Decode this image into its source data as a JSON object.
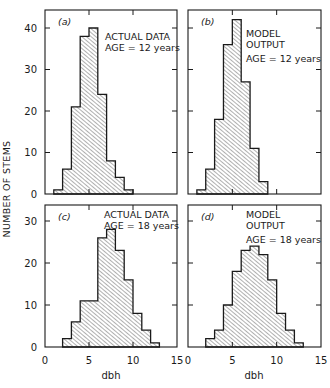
{
  "chart_data": [
    {
      "type": "bar",
      "panel": "(a)",
      "annotation": [
        "ACTUAL DATA",
        "AGE = 12 years"
      ],
      "bin_width": 1,
      "bin_edges_start": 1,
      "categories": [
        "1-2",
        "2-3",
        "3-4",
        "4-5",
        "5-6",
        "6-7",
        "7-8",
        "8-9",
        "9-10"
      ],
      "values": [
        1,
        6,
        21,
        38,
        40,
        24,
        8,
        4,
        1
      ],
      "xlabel": "",
      "ylabel": "NUMBER OF STEMS",
      "xlim": [
        0,
        15
      ],
      "ylim": [
        0,
        44
      ],
      "yticks": [
        0,
        10,
        20,
        30,
        40
      ],
      "xticks": [
        0,
        5,
        10,
        15
      ],
      "fill": "hatched"
    },
    {
      "type": "bar",
      "panel": "(b)",
      "annotation": [
        "MODEL",
        "OUTPUT",
        "AGE = 12 years"
      ],
      "bin_width": 1,
      "bin_edges_start": 1,
      "categories": [
        "1-2",
        "2-3",
        "3-4",
        "4-5",
        "5-6",
        "6-7",
        "7-8",
        "8-9"
      ],
      "values": [
        1,
        6,
        18,
        36,
        42,
        27,
        11,
        3
      ],
      "xlabel": "",
      "ylabel": "",
      "xlim": [
        0,
        15
      ],
      "ylim": [
        0,
        44
      ],
      "yticks": [
        0,
        10,
        20,
        30,
        40
      ],
      "xticks": [
        0,
        5,
        10,
        15
      ],
      "fill": "hatched"
    },
    {
      "type": "bar",
      "panel": "(c)",
      "annotation": [
        "ACTUAL DATA",
        "AGE = 18 years"
      ],
      "bin_width": 1,
      "bin_edges_start": 2,
      "categories": [
        "2-3",
        "3-4",
        "4-5",
        "5-6",
        "6-7",
        "7-8",
        "8-9",
        "9-10",
        "10-11",
        "11-12",
        "12-13"
      ],
      "values": [
        2,
        6,
        11,
        11,
        26,
        28,
        23,
        16,
        8,
        4,
        1
      ],
      "xlabel": "dbh",
      "ylabel": "",
      "xlim": [
        0,
        15
      ],
      "ylim": [
        0,
        34
      ],
      "yticks": [
        0,
        10,
        20,
        30
      ],
      "xticks": [
        0,
        5,
        10,
        15
      ],
      "fill": "hatched"
    },
    {
      "type": "bar",
      "panel": "(d)",
      "annotation": [
        "MODEL",
        "OUTPUT",
        "AGE = 18 years"
      ],
      "bin_width": 1,
      "bin_edges_start": 2,
      "categories": [
        "2-3",
        "3-4",
        "4-5",
        "5-6",
        "6-7",
        "7-8",
        "8-9",
        "9-10",
        "10-11",
        "11-12",
        "12-13"
      ],
      "values": [
        2,
        4,
        10,
        18,
        23,
        24,
        22,
        16,
        8,
        4,
        1
      ],
      "xlabel": "dbh",
      "ylabel": "",
      "xlim": [
        0,
        15
      ],
      "ylim": [
        0,
        34
      ],
      "yticks": [
        0,
        10,
        20,
        30
      ],
      "xticks": [
        0,
        5,
        10,
        15
      ],
      "fill": "hatched"
    }
  ],
  "figure": {
    "ylabel": "NUMBER OF STEMS",
    "xlabel": "dbh",
    "ytick_labels_top": [
      "0",
      "10",
      "20",
      "30",
      "40"
    ],
    "ytick_labels_bottom": [
      "0",
      "10",
      "20",
      "30"
    ],
    "xtick_labels": [
      "0",
      "5",
      "10",
      "15"
    ],
    "colors": {
      "ink": "#1a1a1a",
      "hatch": "#2a2a2a",
      "background": "#ffffff"
    }
  }
}
